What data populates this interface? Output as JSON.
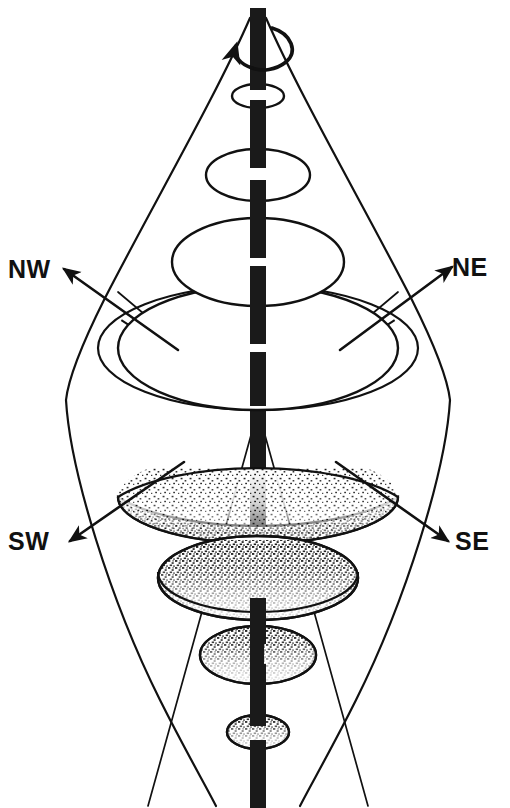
{
  "figure": {
    "background_color": "#ffffff",
    "ink_color": "#111111",
    "width": 510,
    "height": 808
  },
  "labels": {
    "nw": "NW",
    "ne": "NE",
    "sw": "SW",
    "se": "SE"
  },
  "axis": {
    "name": "rotation-axis",
    "color": "#1a1a1a",
    "x": 258,
    "top": 8,
    "bottom": 808,
    "width": 16
  },
  "rotation_arrow": {
    "name": "rotation-direction-arrow",
    "description": "curved arrow encircling the axis indicating spin",
    "center_x": 258,
    "center_y": 40
  },
  "direction_arrows": [
    {
      "name": "nw-arrow",
      "label": "NW",
      "from": [
        170,
        345
      ],
      "to": [
        62,
        268
      ]
    },
    {
      "name": "ne-arrow",
      "label": "NE",
      "from": [
        345,
        345
      ],
      "to": [
        452,
        266
      ]
    },
    {
      "name": "sw-arrow",
      "label": "SW",
      "from": [
        178,
        462
      ],
      "to": [
        68,
        540
      ]
    },
    {
      "name": "se-arrow",
      "label": "SE",
      "from": [
        340,
        462
      ],
      "to": [
        448,
        540
      ]
    }
  ],
  "waist": {
    "name": "convergence-point",
    "x": 258,
    "y": 410
  },
  "disks": [
    {
      "name": "disk-1",
      "cx": 258,
      "cy": 96,
      "rx": 26,
      "ry": 12,
      "fill": "white",
      "stipple": false
    },
    {
      "name": "disk-2",
      "cx": 258,
      "cy": 175,
      "rx": 52,
      "ry": 26,
      "fill": "white",
      "stipple": false
    },
    {
      "name": "disk-3",
      "cx": 258,
      "cy": 262,
      "rx": 86,
      "ry": 44,
      "fill": "white",
      "stipple": false
    },
    {
      "name": "disk-4",
      "cx": 258,
      "cy": 348,
      "rx": 140,
      "ry": 62,
      "fill": "white",
      "stipple": false
    },
    {
      "name": "disk-5",
      "cx": 258,
      "cy": 520,
      "rx": 140,
      "ry": 46,
      "fill": "stipple",
      "stipple": true
    },
    {
      "name": "disk-6",
      "cx": 258,
      "cy": 588,
      "rx": 100,
      "ry": 40,
      "fill": "stipple",
      "stipple": true
    },
    {
      "name": "disk-7",
      "cx": 258,
      "cy": 657,
      "rx": 58,
      "ry": 28,
      "fill": "stipple",
      "stipple": true
    },
    {
      "name": "disk-8",
      "cx": 258,
      "cy": 732,
      "rx": 30,
      "ry": 16,
      "fill": "stipple",
      "stipple": true
    }
  ],
  "silhouette": {
    "name": "hourglass-envelope",
    "description": "lens / hourglass outline enclosing the disk stack, waist at the convergence point"
  },
  "dashed_lines": {
    "name": "hidden-edge-lines",
    "description": "dashed lines from the waist up to the rim of the widest upper disk"
  }
}
